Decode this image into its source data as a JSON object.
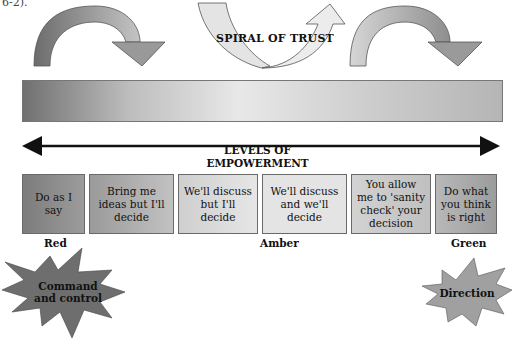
{
  "caption_fragment": "6-2).",
  "spiral": {
    "title": "SPIRAL OF TRUST",
    "arrows": [
      {
        "name": "left-curved-arrow",
        "direction": "clockwise-down",
        "fill": "#8a8a8a"
      },
      {
        "name": "center-spiral-arrow",
        "direction": "up",
        "fill": "#e6e6e6"
      },
      {
        "name": "right-curved-arrow",
        "direction": "clockwise-down",
        "fill": "#b8b8b8"
      }
    ]
  },
  "gradient_bar": {
    "from": "#707070",
    "to": "#e8e8e8"
  },
  "levels": {
    "title_line1": "LEVELS OF",
    "title_line2": "EMPOWERMENT",
    "boxes": [
      {
        "label": "Do as I say",
        "fill": "#8c8c8c"
      },
      {
        "label": "Bring me ideas but I'll decide",
        "fill": "#a8a8a8"
      },
      {
        "label": "We'll discuss but I'll decide",
        "fill": "#d6d6d6"
      },
      {
        "label": "We'll discuss and we'll decide",
        "fill": "#e4e4e4"
      },
      {
        "label": "You allow me to 'sanity check' your decision",
        "fill": "#c9c9c9"
      },
      {
        "label": "Do what you think is right",
        "fill": "#a9a9a9"
      }
    ],
    "zones": {
      "red": "Red",
      "amber": "Amber",
      "green": "Green"
    }
  },
  "bursts": {
    "left": {
      "line1": "Command",
      "line2": "and control",
      "fill": "#6e6e6e"
    },
    "right": {
      "label": "Direction",
      "fill": "#a0a0a0"
    }
  }
}
